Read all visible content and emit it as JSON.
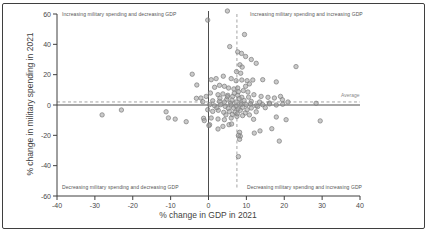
{
  "figure": {
    "background": "#ffffff",
    "border_color": "#3f3f3f"
  },
  "chart_data": {
    "type": "scatter",
    "title": "",
    "xlabel": "% change in GDP in 2021",
    "ylabel": "% change in military spending in 2021",
    "xlim": [
      -40,
      40
    ],
    "ylim": [
      -60,
      60
    ],
    "x_ticks": [
      -40,
      -30,
      -20,
      -10,
      0,
      10,
      20,
      30,
      40
    ],
    "y_ticks": [
      -60,
      -40,
      -20,
      0,
      20,
      40,
      60
    ],
    "grid": false,
    "legend_position": "none",
    "quadrant_labels": {
      "top_left": "Increasing military spending and decreasing GDP",
      "top_right": "Increasing military spending and increasing GDP",
      "bottom_left": "Decreasing military spending and decreasing GDP",
      "bottom_right": "Decreasing military spending and increasing GDP"
    },
    "reference_lines": {
      "horizontal_average": {
        "value": 2,
        "label": "Average",
        "style": "dashed"
      },
      "vertical_gdp_average": {
        "value": 7.5,
        "style": "dashed"
      },
      "x_zero": 0,
      "y_zero": 0
    },
    "style": {
      "marker_fill": "#9e9e9e",
      "marker_edge": "#7f7f7f",
      "axis_color": "#3f3f3f",
      "zero_line_color": "#4d4d4d",
      "dashed_color": "#999999",
      "text_color": "#4a4a4a"
    },
    "points": [
      [
        -28.1,
        -6.5
      ],
      [
        -23.0,
        -3.3
      ],
      [
        -11.2,
        -4.5
      ],
      [
        -10.6,
        -8.5
      ],
      [
        -8.8,
        -9.3
      ],
      [
        -5.9,
        -11.0
      ],
      [
        -4.3,
        20.3
      ],
      [
        -3.1,
        13.2
      ],
      [
        -3.2,
        4.4
      ],
      [
        -2.0,
        4.6
      ],
      [
        -0.6,
        5.7
      ],
      [
        -1.5,
        2.2
      ],
      [
        -1.3,
        -8.8
      ],
      [
        -1.1,
        -10.3
      ],
      [
        -0.2,
        -3.1
      ],
      [
        -0.2,
        56.0
      ],
      [
        5.0,
        62.0
      ],
      [
        9.5,
        46.5
      ],
      [
        5.6,
        38.5
      ],
      [
        7.7,
        35.0
      ],
      [
        8.7,
        34.0
      ],
      [
        9.8,
        32.0
      ],
      [
        11.3,
        30.0
      ],
      [
        12.6,
        27.5
      ],
      [
        23.1,
        25.3
      ],
      [
        8.3,
        26.5
      ],
      [
        8.9,
        25.0
      ],
      [
        7.4,
        22.0
      ],
      [
        8.5,
        21.0
      ],
      [
        3.9,
        19.0
      ],
      [
        0.7,
        16.7
      ],
      [
        2.0,
        17.4
      ],
      [
        6.0,
        17.4
      ],
      [
        7.3,
        16.0
      ],
      [
        8.8,
        16.5
      ],
      [
        11.7,
        16.5
      ],
      [
        10.2,
        16.0
      ],
      [
        10.8,
        13.9
      ],
      [
        9.8,
        12.3
      ],
      [
        14.3,
        16.7
      ],
      [
        17.9,
        15.2
      ],
      [
        1.6,
        11.7
      ],
      [
        2.9,
        13.0
      ],
      [
        4.2,
        12.3
      ],
      [
        5.3,
        11.2
      ],
      [
        6.7,
        10.6
      ],
      [
        7.7,
        11.2
      ],
      [
        9.2,
        9.5
      ],
      [
        10.4,
        8.6
      ],
      [
        12.0,
        6.8
      ],
      [
        13.9,
        5.7
      ],
      [
        15.7,
        5.1
      ],
      [
        17.4,
        4.6
      ],
      [
        19.0,
        5.7
      ],
      [
        0.5,
        7.9
      ],
      [
        2.5,
        6.8
      ],
      [
        3.8,
        7.3
      ],
      [
        5.1,
        6.4
      ],
      [
        6.4,
        5.7
      ],
      [
        7.7,
        6.4
      ],
      [
        8.8,
        5.1
      ],
      [
        6.8,
        7.8
      ],
      [
        7.9,
        8.8
      ],
      [
        1.1,
        2.8
      ],
      [
        2.9,
        2.4
      ],
      [
        4.2,
        2.0
      ],
      [
        5.8,
        1.3
      ],
      [
        7.3,
        2.0
      ],
      [
        8.6,
        1.3
      ],
      [
        3.0,
        4.5
      ],
      [
        4.8,
        3.8
      ],
      [
        6.2,
        3.2
      ],
      [
        5.0,
        5.5
      ],
      [
        8.1,
        4.2
      ],
      [
        9.4,
        3.0
      ],
      [
        10.6,
        5.2
      ],
      [
        11.3,
        2.4
      ],
      [
        13.5,
        2.0
      ],
      [
        16.1,
        1.3
      ],
      [
        19.5,
        3.5
      ],
      [
        21.0,
        2.0
      ],
      [
        0.3,
        0.2
      ],
      [
        1.6,
        -0.5
      ],
      [
        3.2,
        0.2
      ],
      [
        4.4,
        -0.9
      ],
      [
        6.0,
        0.0
      ],
      [
        7.3,
        -0.9
      ],
      [
        8.6,
        0.2
      ],
      [
        10.0,
        0.2
      ],
      [
        11.1,
        0.7
      ],
      [
        12.6,
        -0.5
      ],
      [
        14.3,
        0.2
      ],
      [
        16.1,
        0.7
      ],
      [
        17.9,
        0.0
      ],
      [
        19.6,
        0.5
      ],
      [
        28.4,
        1.1
      ],
      [
        13.0,
        -1.0
      ],
      [
        15.0,
        -1.8
      ],
      [
        1.1,
        -4.2
      ],
      [
        2.6,
        -3.5
      ],
      [
        4.0,
        -4.8
      ],
      [
        5.5,
        -4.2
      ],
      [
        7.0,
        -4.8
      ],
      [
        8.4,
        -3.5
      ],
      [
        2.2,
        -1.8
      ],
      [
        5.2,
        -2.2
      ],
      [
        6.6,
        -2.0
      ],
      [
        7.8,
        -2.5
      ],
      [
        9.0,
        -1.5
      ],
      [
        10.2,
        -3.1
      ],
      [
        11.3,
        -2.0
      ],
      [
        9.7,
        -5.3
      ],
      [
        12.6,
        -4.5
      ],
      [
        0.7,
        -8.6
      ],
      [
        2.5,
        -9.2
      ],
      [
        4.2,
        -9.7
      ],
      [
        6.0,
        -8.6
      ],
      [
        7.5,
        -7.5
      ],
      [
        9.0,
        -7.0
      ],
      [
        4.6,
        -6.5
      ],
      [
        6.3,
        -6.2
      ],
      [
        7.6,
        -5.8
      ],
      [
        10.8,
        -6.5
      ],
      [
        11.9,
        -9.4
      ],
      [
        17.9,
        -7.9
      ],
      [
        29.5,
        -10.5
      ],
      [
        20.5,
        -9.7
      ],
      [
        0.3,
        -13.0
      ],
      [
        3.8,
        -14.1
      ],
      [
        0.1,
        -13.6
      ],
      [
        2.5,
        -15.8
      ],
      [
        5.4,
        -13.0
      ],
      [
        6.1,
        -12.5
      ],
      [
        8.2,
        -18.0
      ],
      [
        8.4,
        -20.6
      ],
      [
        12.1,
        -18.5
      ],
      [
        13.6,
        -17.1
      ],
      [
        16.7,
        -15.6
      ],
      [
        7.9,
        -20.0
      ],
      [
        8.2,
        -22.6
      ],
      [
        18.7,
        -23.8
      ],
      [
        7.9,
        -34.0
      ]
    ]
  }
}
